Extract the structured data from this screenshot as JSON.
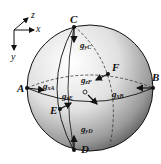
{
  "axes": {
    "x": "x",
    "y": "y",
    "z": "z"
  },
  "points": {
    "A": "A",
    "B": "B",
    "C": "C",
    "D": "D",
    "E": "E",
    "F": "F"
  },
  "vectors": {
    "gxA": {
      "base": "g",
      "sub": "xA"
    },
    "gxB": {
      "base": "g",
      "sub": "xB"
    },
    "gyC": {
      "base": "g",
      "sub": "yC"
    },
    "gyD": {
      "base": "g",
      "sub": "yD"
    },
    "gzE": {
      "base": "g",
      "sub": "zE"
    },
    "gzF": {
      "base": "g",
      "sub": "zF"
    },
    "gzO": {
      "base": "g",
      "sub": "zF"
    }
  },
  "colors": {
    "sphere_light": "#f2f2f2",
    "sphere_dark": "#3a3a3a",
    "line": "#111111"
  }
}
